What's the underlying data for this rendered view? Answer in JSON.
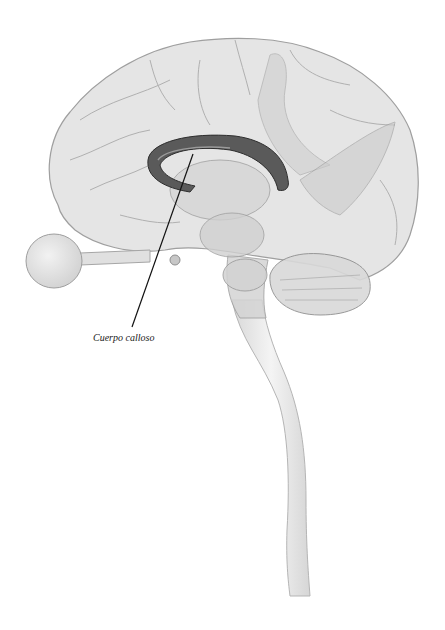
{
  "figure": {
    "labels": [
      {
        "id": "corpus-callosum",
        "text": "Cuerpo calloso",
        "x": 93,
        "y": 333,
        "pointer_from": [
          132,
          327
        ],
        "pointer_to": [
          193,
          154
        ]
      }
    ],
    "colors": {
      "background": "#ffffff",
      "brain_fill": "#e2e2e2",
      "brain_stroke": "#9a9a9a",
      "corpus_callosum": "#4a4a4a",
      "leader_line": "#111111",
      "label_text": "#1a1a1a"
    }
  }
}
